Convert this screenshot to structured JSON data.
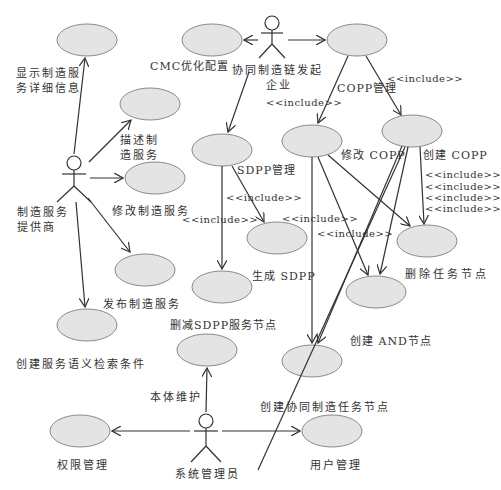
{
  "diagram": {
    "type": "uml-use-case",
    "actors": [
      {
        "id": "mfg_provider",
        "label_line1": "制造服务",
        "label_line2": "提供商"
      },
      {
        "id": "initiator",
        "label_line1": "协同制造链发起",
        "label_line2": "企业"
      },
      {
        "id": "sysadmin",
        "label": "系统管理员"
      }
    ],
    "use_cases": {
      "show_detail": {
        "line1": "显示制造服",
        "line2": "务详细信息"
      },
      "describe_service": {
        "line1": "描述制",
        "line2": "造服务"
      },
      "modify_service": "修改制造服务",
      "publish_service": "发布制造服务",
      "semantic_search": "创建服务语义检索条件",
      "cmc_optimize": "CMC优化配置",
      "copp_manage": "COPP管理",
      "sdpp_manage": "SDPP管理",
      "modify_copp": "修改 COPP",
      "create_copp": "创建 COPP",
      "generate_sdpp": "生成 SDPP",
      "delete_task_node": "删除任务节点",
      "create_and_node": "创建 AND节点",
      "reduce_sdpp_node": "删减SDPP服务节点",
      "create_collab_task_node": "创建协同制造任务节点",
      "ontology_maintain": "本体维护",
      "permission_manage": "权限管理",
      "user_manage": "用户管理"
    },
    "stereotypes": {
      "include": "<<include>>"
    },
    "colors": {
      "use_case_fill": "#e4e4e4",
      "use_case_stroke": "#8a8a8a",
      "line": "#333333"
    }
  }
}
